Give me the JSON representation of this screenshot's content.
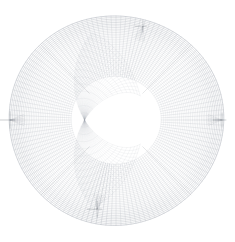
{
  "figure": {
    "kind": "mesh-wireframe",
    "background_color": "#ffffff",
    "canvas": {
      "width": 235,
      "height": 242
    }
  },
  "chart_data": {
    "type": "mesh",
    "subtitle": "",
    "xlabel": "",
    "ylabel": "",
    "grid": true,
    "legend": null,
    "axes_visible": false,
    "tick_labels": [],
    "annotations": [],
    "domain": {
      "shape": "disk",
      "center_x": 116,
      "center_y": 120,
      "radius": 106
    },
    "topology": {
      "scheme": "o-grid-butterfly",
      "blocks": 5,
      "radial_divisions": 34,
      "angular_divisions": 132,
      "core_divisions": 26,
      "quad_cell_px": 3.4
    },
    "style": {
      "line_color": "#9aa0a8",
      "line_color_dense": "#6f757d",
      "line_width": 0.32,
      "line_width_seam": 0.55,
      "rim_line_color": "#b4b9c0",
      "opacity_center": 0.22,
      "opacity_rim": 0.72
    },
    "singularities": [
      {
        "name": "left-node",
        "angle_deg": 180,
        "radius_frac": 1.0,
        "intensity": 0.95
      },
      {
        "name": "right-node",
        "angle_deg": 0,
        "radius_frac": 1.0,
        "intensity": 0.8
      },
      {
        "name": "bottom-node",
        "angle_deg": 258,
        "radius_frac": 0.86,
        "intensity": 0.9
      },
      {
        "name": "top-right-node",
        "angle_deg": 74,
        "radius_frac": 0.92,
        "intensity": 0.7
      }
    ],
    "seams": [
      {
        "name": "seam-upper-left",
        "angle_deg": 135
      },
      {
        "name": "seam-upper-right",
        "angle_deg": 45
      },
      {
        "name": "seam-lower-left",
        "angle_deg": 225
      },
      {
        "name": "seam-lower-right",
        "angle_deg": 315
      }
    ]
  }
}
